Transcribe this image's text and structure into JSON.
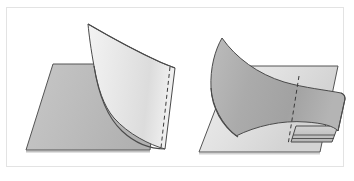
{
  "figure": {
    "caption": "",
    "width": 354,
    "height": 181,
    "background_color": "#ffffff",
    "frame": {
      "visible": true,
      "stroke_color": "#e3e3e3",
      "stroke_width": 1,
      "x": 6,
      "y": 7,
      "width": 338,
      "height": 160
    },
    "panels": [
      {
        "id": "panel-left",
        "label": "",
        "description": "Light curved sheet standing above a darker planar parallelogram",
        "base_plane": {
          "name": "base-plane-left",
          "fill_color": "#b9b9b9",
          "fill_color_light": "#c6c6c6",
          "stroke_color": "#545454",
          "stroke_width": 1,
          "points": "53,64 160,64 150,150 26,150"
        },
        "curved_sheet": {
          "name": "curved-sheet-left",
          "fill_color": "#e9e9e9",
          "fill_color_light": "#f5f5f5",
          "stroke_color": "#4a4a4a",
          "stroke_width": 1,
          "path": "M88,24 C120,40 150,55 173,68 L163,148 C140,140 112,122 101,96 C95,80 92,50 88,24 Z"
        },
        "crease_dashed": {
          "name": "crease-dashed-left",
          "stroke_color": "#3a3a3a",
          "stroke_width": 1,
          "dash_pattern": "4,3",
          "path": "M169,67 L160,148"
        }
      },
      {
        "id": "panel-right",
        "label": "",
        "description": "Darker curved sheet folded over a lighter planar parallelogram, with a rolled lip at the lower edge",
        "base_plane": {
          "name": "base-plane-right",
          "fill_color": "#e2e2e2",
          "fill_color_light": "#efefef",
          "stroke_color": "#545454",
          "stroke_width": 1,
          "points": "232,66 338,66 320,152 199,152"
        },
        "curved_sheet": {
          "name": "curved-sheet-right",
          "fill_color": "#a9a9a9",
          "fill_color_light": "#bdbdbd",
          "stroke_color": "#4a4a4a",
          "stroke_width": 1,
          "path": "M222,38 C248,62 278,78 312,83 C328,85 337,88 340,95 L338,133 C334,128 322,124 308,122 C280,118 252,124 232,132 C212,120 206,98 209,76 C211,60 216,48 222,38 Z"
        },
        "crease_dashed": {
          "name": "crease-dashed-right",
          "stroke_color": "#3a3a3a",
          "stroke_width": 1,
          "dash_pattern": "4,3",
          "path": "M295,74 L286,144"
        },
        "fold_lip": {
          "name": "fold-lip-right",
          "fill_color": "#c8c8c8",
          "stroke_color": "#4a4a4a",
          "stroke_width": 1,
          "outer_path": "M289,140 L293,129 L335,129 L331,140 Z",
          "inner_path": "M290,136 L332,136",
          "tip_path": "M290,133 L331,133"
        }
      }
    ],
    "palette": {
      "stroke_dark": "#4a4a4a",
      "frame_gray": "#e3e3e3",
      "sheet_light": "#e9e9e9",
      "sheet_dark": "#a9a9a9",
      "base_dark": "#b9b9b9",
      "base_light": "#e2e2e2",
      "page_white": "#ffffff"
    }
  }
}
